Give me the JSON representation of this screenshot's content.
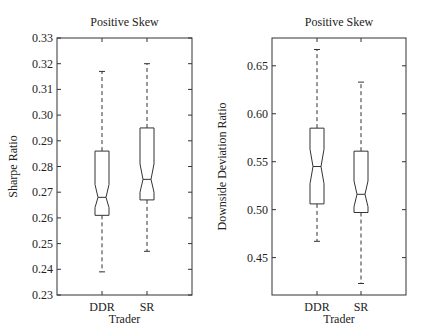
{
  "chart_data": [
    {
      "type": "box",
      "title": "Positive Skew",
      "xlabel": "Trader",
      "ylabel": "Sharpe Ratio",
      "categories": [
        "DDR",
        "SR"
      ],
      "ylim": [
        0.23,
        0.33
      ],
      "yticks": [
        0.23,
        0.24,
        0.25,
        0.26,
        0.27,
        0.28,
        0.29,
        0.3,
        0.31,
        0.32,
        0.33
      ],
      "ytick_labels": [
        "0.23",
        "0.24",
        "0.25",
        "0.26",
        "0.27",
        "0.28",
        "0.29",
        "0.30",
        "0.31",
        "0.32",
        "0.33"
      ],
      "notched": true,
      "grid": false,
      "boxes": [
        {
          "name": "DDR",
          "whisker_low": 0.239,
          "q1": 0.261,
          "median": 0.268,
          "q3": 0.286,
          "whisker_high": 0.317,
          "notch_low": 0.264,
          "notch_high": 0.273
        },
        {
          "name": "SR",
          "whisker_low": 0.247,
          "q1": 0.267,
          "median": 0.275,
          "q3": 0.295,
          "whisker_high": 0.32,
          "notch_low": 0.27,
          "notch_high": 0.281
        }
      ]
    },
    {
      "type": "box",
      "title": "Positive Skew",
      "xlabel": "Trader",
      "ylabel": "Downside Deviation Ratio",
      "categories": [
        "DDR",
        "SR"
      ],
      "ylim": [
        0.411,
        0.679
      ],
      "yticks": [
        0.45,
        0.5,
        0.55,
        0.6,
        0.65
      ],
      "ytick_labels": [
        "0.45",
        "0.50",
        "0.55",
        "0.60",
        "0.65"
      ],
      "notched": true,
      "grid": false,
      "boxes": [
        {
          "name": "DDR",
          "whisker_low": 0.467,
          "q1": 0.506,
          "median": 0.545,
          "q3": 0.585,
          "whisker_high": 0.667,
          "notch_low": 0.527,
          "notch_high": 0.563
        },
        {
          "name": "SR",
          "whisker_low": 0.423,
          "q1": 0.497,
          "median": 0.516,
          "q3": 0.561,
          "whisker_high": 0.633,
          "notch_low": 0.503,
          "notch_high": 0.53
        }
      ]
    }
  ],
  "plots": [
    {
      "layout": {
        "x0": 57,
        "x1": 192,
        "y0": 38,
        "y1": 295,
        "cx": [
          102,
          147
        ],
        "half_w": 7,
        "notch_w": 4,
        "cap_w": 3,
        "ylabel_x": 17
      }
    },
    {
      "layout": {
        "x0": 272,
        "x1": 406,
        "y0": 38,
        "y1": 295,
        "cx": [
          317,
          361
        ],
        "half_w": 7,
        "notch_w": 4,
        "cap_w": 3,
        "ylabel_x": 226
      }
    }
  ]
}
